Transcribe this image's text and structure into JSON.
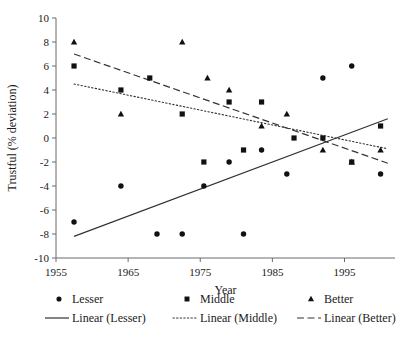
{
  "chart_data": {
    "type": "scatter",
    "title": "",
    "xlabel": "Year",
    "ylabel": "Trustful (% deviation)",
    "xlim": [
      1955,
      2002
    ],
    "ylim": [
      -10,
      10
    ],
    "xticks": [
      1955,
      1965,
      1975,
      1985,
      1995
    ],
    "yticks": [
      10,
      8,
      6,
      4,
      2,
      0,
      -2,
      -4,
      -6,
      -8,
      -10
    ],
    "grid": false,
    "legend_position": "bottom",
    "series": [
      {
        "name": "Lesser",
        "marker": "circle",
        "x": [
          1957.5,
          1964,
          1969,
          1972.5,
          1975.5,
          1979,
          1981,
          1983.5,
          1987,
          1992,
          1996,
          2000
        ],
        "values": [
          -7,
          -4,
          -8,
          -8,
          -4,
          -2,
          -8,
          -1,
          -3,
          5,
          6,
          -3
        ]
      },
      {
        "name": "Middle",
        "marker": "square",
        "x": [
          1957.5,
          1964,
          1968,
          1972.5,
          1975.5,
          1979,
          1981,
          1983.5,
          1988,
          1992,
          1996,
          2000
        ],
        "values": [
          6,
          4,
          5,
          2,
          -2,
          3,
          -1,
          3,
          0,
          0,
          -2,
          1
        ]
      },
      {
        "name": "Better",
        "marker": "triangle",
        "x": [
          1957.5,
          1964,
          1972.5,
          1976,
          1979,
          1983.5,
          1987,
          1992,
          1996,
          2000
        ],
        "values": [
          8,
          2,
          8,
          5,
          4,
          1,
          2,
          -1,
          -2,
          -1
        ]
      }
    ],
    "trendlines": [
      {
        "name": "Linear (Lesser)",
        "style": "solid",
        "x": [
          1957.5,
          2001
        ],
        "values": [
          -8.2,
          1.6
        ]
      },
      {
        "name": "Linear (Middle)",
        "style": "dotted",
        "x": [
          1957.5,
          2001
        ],
        "values": [
          4.5,
          -0.9
        ]
      },
      {
        "name": "Linear (Better)",
        "style": "dashed",
        "x": [
          1957.5,
          2001
        ],
        "values": [
          7.0,
          -2.1
        ]
      }
    ]
  },
  "axes": {
    "ylabel": "Trustful (% deviation)",
    "xlabel": "Year",
    "xtick_labels": [
      "1955",
      "1965",
      "1975",
      "1985",
      "1995"
    ],
    "ytick_labels": [
      "10",
      "8",
      "6",
      "4",
      "2",
      "0",
      "-2",
      "-4",
      "-6",
      "-8",
      "-10"
    ]
  },
  "legend": {
    "markers": [
      {
        "label": "Lesser",
        "marker": "circle"
      },
      {
        "label": "Middle",
        "marker": "square"
      },
      {
        "label": "Better",
        "marker": "triangle"
      }
    ],
    "lines": [
      {
        "label": "Linear (Lesser)",
        "style": "solid"
      },
      {
        "label": "Linear (Middle)",
        "style": "dotted"
      },
      {
        "label": "Linear (Better)",
        "style": "dashed"
      }
    ]
  },
  "colors": {
    "marker": "#111111",
    "axis": "#6b6b6b",
    "trend": "#333333",
    "text": "#1a1a1a",
    "background": "#ffffff"
  }
}
